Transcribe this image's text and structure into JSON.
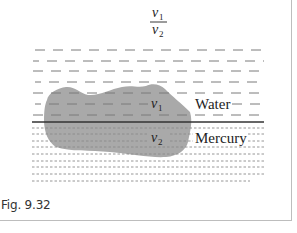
{
  "figure": {
    "caption": "Fig. 9.32",
    "ratio": {
      "numerator": "v",
      "numerator_sub": "1",
      "denominator": "v",
      "denominator_sub": "2"
    },
    "labels": {
      "water": "Water",
      "mercury": "Mercury",
      "v1": "v",
      "v1_sub": "1",
      "v2": "v",
      "v2_sub": "2"
    },
    "colors": {
      "blob": "#a9a9a9",
      "water_dash": "#7a7a7a",
      "mercury_dot": "#8a8a8a",
      "interface": "#333333",
      "frame": "#bdbdbd"
    }
  }
}
